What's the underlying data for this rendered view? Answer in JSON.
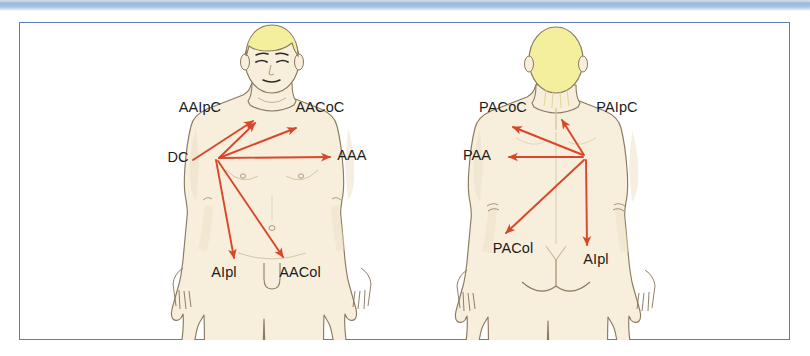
{
  "figure": {
    "frame": {
      "border_color": "#5b7fb4",
      "background": "#ffffff"
    },
    "banner": {
      "color": "#a8c4e0"
    },
    "palette": {
      "skin": "#f7eedb",
      "skin_shadow": "#ece0c8",
      "hair": "#f4ef9d",
      "outline": "#7a6a52",
      "arrow": "#d9472b",
      "label_text": "#1c1c1c"
    },
    "views": [
      {
        "name": "anterior-view",
        "view_label": "anterior",
        "hub": {
          "x": 218,
          "y": 157
        },
        "labels": [
          {
            "id": "aaipc",
            "text": "AAIpC",
            "x": 200,
            "y": 112,
            "anchor": "middle"
          },
          {
            "id": "aacoc",
            "text": "AACoC",
            "x": 320,
            "y": 112,
            "anchor": "middle"
          },
          {
            "id": "dc",
            "text": "DC",
            "x": 178,
            "y": 162,
            "anchor": "middle"
          },
          {
            "id": "aaa",
            "text": "AAA",
            "x": 352,
            "y": 160,
            "anchor": "middle"
          },
          {
            "id": "aipl",
            "text": "AIpl",
            "x": 224,
            "y": 277,
            "anchor": "middle"
          },
          {
            "id": "aacol",
            "text": "AACol",
            "x": 300,
            "y": 277,
            "anchor": "middle"
          }
        ],
        "arrows": [
          {
            "id": "dc-to-aaipc-upper",
            "from": {
              "x": 193,
              "y": 160
            },
            "to": {
              "x": 253,
              "y": 121
            }
          },
          {
            "id": "hub-to-aaipc",
            "from": {
              "x": 219,
              "y": 158
            },
            "to": {
              "x": 255,
              "y": 123
            }
          },
          {
            "id": "hub-to-aacoc",
            "from": {
              "x": 219,
              "y": 158
            },
            "to": {
              "x": 296,
              "y": 128
            }
          },
          {
            "id": "hub-to-aaa",
            "from": {
              "x": 219,
              "y": 158
            },
            "to": {
              "x": 330,
              "y": 157
            }
          },
          {
            "id": "hub-to-aipl",
            "from": {
              "x": 216,
              "y": 160
            },
            "to": {
              "x": 234,
              "y": 258
            }
          },
          {
            "id": "hub-to-aacol",
            "from": {
              "x": 218,
              "y": 161
            },
            "to": {
              "x": 283,
              "y": 257
            }
          }
        ]
      },
      {
        "name": "posterior-view",
        "view_label": "posterior",
        "hub": {
          "x": 585,
          "y": 157
        },
        "labels": [
          {
            "id": "pacoc",
            "text": "PACoC",
            "x": 503,
            "y": 112,
            "anchor": "middle"
          },
          {
            "id": "paipc",
            "text": "PAIpC",
            "x": 617,
            "y": 112,
            "anchor": "middle"
          },
          {
            "id": "paa",
            "text": "PAA",
            "x": 477,
            "y": 160,
            "anchor": "middle"
          },
          {
            "id": "pacol",
            "text": "PACol",
            "x": 513,
            "y": 253,
            "anchor": "middle"
          },
          {
            "id": "aipl2",
            "text": "AIpl",
            "x": 596,
            "y": 264,
            "anchor": "middle"
          }
        ],
        "arrows": [
          {
            "id": "hub-to-pacoc",
            "from": {
              "x": 583,
              "y": 155
            },
            "to": {
              "x": 513,
              "y": 127
            }
          },
          {
            "id": "hub-to-paipc",
            "from": {
              "x": 584,
              "y": 155
            },
            "to": {
              "x": 562,
              "y": 120
            }
          },
          {
            "id": "hub-to-paa",
            "from": {
              "x": 583,
              "y": 157
            },
            "to": {
              "x": 509,
              "y": 157
            }
          },
          {
            "id": "hub-to-pacol",
            "from": {
              "x": 584,
              "y": 160
            },
            "to": {
              "x": 506,
              "y": 233
            }
          },
          {
            "id": "hub-to-aipl2",
            "from": {
              "x": 586,
              "y": 160
            },
            "to": {
              "x": 587,
              "y": 245
            }
          }
        ]
      }
    ]
  }
}
